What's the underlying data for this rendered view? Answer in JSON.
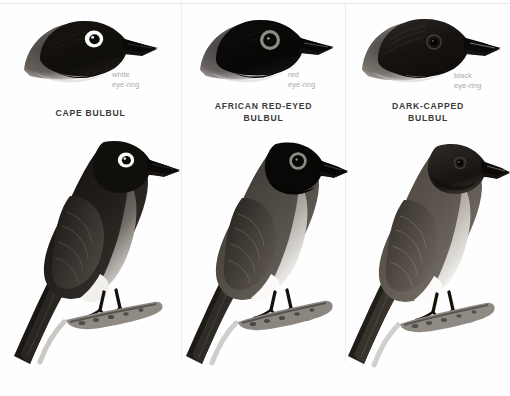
{
  "plate": {
    "type": "bird-identification-plate",
    "background_color": "#ffffff",
    "divider_color": "#ececec",
    "panel_count": 3
  },
  "panels": [
    {
      "id": "cape-bulbul",
      "species_name": "CAPE BULBUL",
      "eye_ring_label": "white\neye-ring",
      "eye_ring_color_name": "white",
      "eye_ring_hex": "#ffffff",
      "head_plumage": "all-dark brown-black head",
      "body_plumage": "dark brown upperparts, pale grey-brown underparts, whitish vent"
    },
    {
      "id": "african-red-eyed-bulbul",
      "species_name": "AFRICAN RED-EYED\nBULBUL",
      "eye_ring_label": "red\neye-ring",
      "eye_ring_color_name": "red",
      "eye_ring_hex": "#8f8f8f",
      "head_plumage": "glossy black hood sharply demarcated",
      "body_plumage": "greyish-brown back, pale grey breast, white belly"
    },
    {
      "id": "dark-capped-bulbul",
      "species_name": "DARK-CAPPED\nBULBUL",
      "eye_ring_label": "black\neye-ring",
      "eye_ring_color_name": "black",
      "eye_ring_hex": "#1a1a1a",
      "head_plumage": "dark brown cap blending into body",
      "body_plumage": "brown upperparts, buff-grey breast, whitish belly"
    }
  ],
  "colors": {
    "label_text": "#3a3a3a",
    "ring_text": "#a9a9a9",
    "ink_dark": "#1c1c1c",
    "ink_mid": "#5a5a5a",
    "ink_light": "#b6b6b6"
  }
}
